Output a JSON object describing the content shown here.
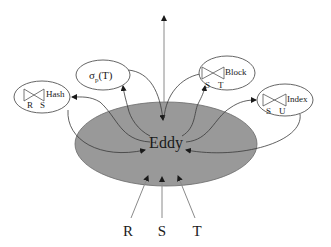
{
  "diagram": {
    "type": "eddy-query-processing",
    "center": {
      "label": "Eddy",
      "fill": "#999999"
    },
    "operators": [
      {
        "id": "hash",
        "label": "Hash",
        "kind": "join",
        "inputs": [
          "R",
          "S"
        ]
      },
      {
        "id": "select",
        "label": "σ",
        "subscript": "p",
        "arg": "(T)",
        "kind": "selection"
      },
      {
        "id": "block",
        "label": "Block",
        "kind": "join",
        "inputs": [
          "S",
          "T"
        ]
      },
      {
        "id": "index",
        "label": "Index",
        "kind": "join",
        "inputs": [
          "S",
          "U"
        ]
      }
    ],
    "inputs": [
      "R",
      "S",
      "T"
    ],
    "output_arrow": "up"
  }
}
